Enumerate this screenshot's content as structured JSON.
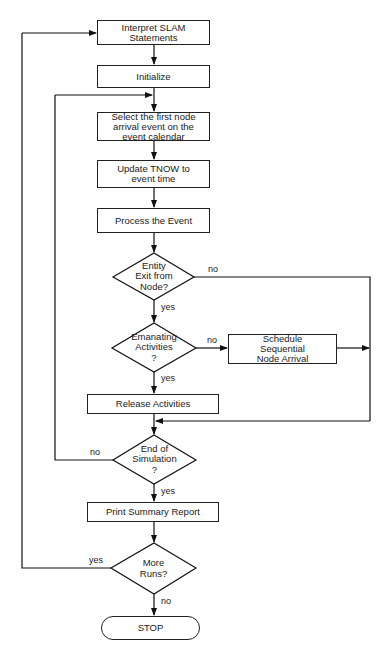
{
  "diagram": {
    "type": "flowchart",
    "nodes": {
      "interpret": {
        "label": "Interpret SLAM\nStatements",
        "shape": "process"
      },
      "initialize": {
        "label": "Initialize",
        "shape": "process"
      },
      "select": {
        "label": "Select the first node\narrival event on the\nevent calendar",
        "shape": "process"
      },
      "update": {
        "label": "Update TNOW to\nevent time",
        "shape": "process"
      },
      "process": {
        "label": "Process the Event",
        "shape": "process"
      },
      "entity_exit": {
        "label": "Entity\nExit from\nNode?",
        "shape": "decision"
      },
      "emanating": {
        "label": "Emanating\nActivities\n?",
        "shape": "decision"
      },
      "schedule": {
        "label": "Schedule\nSequential\nNode Arrival",
        "shape": "process"
      },
      "release": {
        "label": "Release Activities",
        "shape": "process"
      },
      "end_sim": {
        "label": "End of\nSimulation\n?",
        "shape": "decision"
      },
      "print": {
        "label": "Print Summary Report",
        "shape": "process"
      },
      "more_runs": {
        "label": "More\nRuns?",
        "shape": "decision"
      },
      "stop": {
        "label": "STOP",
        "shape": "terminal"
      }
    },
    "edge_labels": {
      "entity_exit_no": "no",
      "entity_exit_yes": "yes",
      "emanating_no": "no",
      "emanating_yes": "yes",
      "end_sim_no": "no",
      "end_sim_yes": "yes",
      "more_runs_yes": "yes",
      "more_runs_no": "no"
    },
    "edges": [
      {
        "from": "interpret",
        "to": "initialize"
      },
      {
        "from": "initialize",
        "to": "select"
      },
      {
        "from": "select",
        "to": "update"
      },
      {
        "from": "update",
        "to": "process"
      },
      {
        "from": "process",
        "to": "entity_exit"
      },
      {
        "from": "entity_exit",
        "to": "emanating",
        "label": "yes"
      },
      {
        "from": "entity_exit",
        "to": "end_sim",
        "label": "no"
      },
      {
        "from": "emanating",
        "to": "release",
        "label": "yes"
      },
      {
        "from": "emanating",
        "to": "schedule",
        "label": "no"
      },
      {
        "from": "schedule",
        "to": "end_sim"
      },
      {
        "from": "release",
        "to": "end_sim"
      },
      {
        "from": "end_sim",
        "to": "select",
        "label": "no"
      },
      {
        "from": "end_sim",
        "to": "print",
        "label": "yes"
      },
      {
        "from": "print",
        "to": "more_runs"
      },
      {
        "from": "more_runs",
        "to": "interpret",
        "label": "yes"
      },
      {
        "from": "more_runs",
        "to": "stop",
        "label": "no"
      }
    ]
  }
}
